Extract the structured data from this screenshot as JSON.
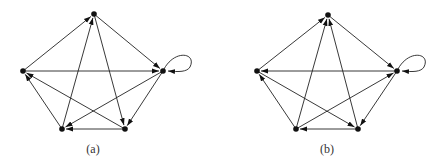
{
  "figures": [
    {
      "id": "a",
      "caption": "(a)",
      "caption_pos": {
        "x": 93,
        "y": 142
      },
      "nodes": [
        {
          "id": "T",
          "x": 94,
          "y": 14
        },
        {
          "id": "L",
          "x": 23,
          "y": 71
        },
        {
          "id": "R",
          "x": 163,
          "y": 71
        },
        {
          "id": "BL",
          "x": 62,
          "y": 129
        },
        {
          "id": "BR",
          "x": 125,
          "y": 129
        }
      ],
      "edges": [
        {
          "from": "L",
          "to": "T"
        },
        {
          "from": "BL",
          "to": "T"
        },
        {
          "from": "T",
          "to": "R"
        },
        {
          "from": "T",
          "to": "BR"
        },
        {
          "from": "L",
          "to": "R"
        },
        {
          "from": "R",
          "to": "BL"
        },
        {
          "from": "R",
          "to": "BR"
        },
        {
          "from": "BR",
          "to": "BL"
        },
        {
          "from": "BL",
          "to": "L"
        },
        {
          "from": "BR",
          "to": "L"
        },
        {
          "from": "R",
          "to": "R",
          "loop": true
        }
      ]
    },
    {
      "id": "b",
      "caption": "(b)",
      "caption_pos": {
        "x": 327,
        "y": 142
      },
      "nodes": [
        {
          "id": "T",
          "x": 328,
          "y": 15
        },
        {
          "id": "L",
          "x": 257,
          "y": 71
        },
        {
          "id": "R",
          "x": 397,
          "y": 71
        },
        {
          "id": "BL",
          "x": 296,
          "y": 129
        },
        {
          "id": "BR",
          "x": 358,
          "y": 129
        }
      ],
      "edges": [
        {
          "from": "L",
          "to": "T"
        },
        {
          "from": "BL",
          "to": "T"
        },
        {
          "from": "BR",
          "to": "T"
        },
        {
          "from": "T",
          "to": "R"
        },
        {
          "from": "R",
          "to": "L"
        },
        {
          "from": "BL",
          "to": "L"
        },
        {
          "from": "L",
          "to": "BR"
        },
        {
          "from": "BL",
          "to": "R"
        },
        {
          "from": "R",
          "to": "BR"
        },
        {
          "from": "BR",
          "to": "BL"
        },
        {
          "from": "R",
          "to": "R",
          "loop": true
        }
      ]
    }
  ]
}
